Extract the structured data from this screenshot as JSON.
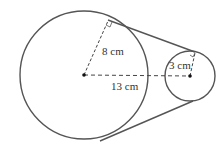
{
  "diagram": {
    "type": "two circles with external common tangents",
    "large_circle": {
      "radius_label": "8 cm"
    },
    "small_circle": {
      "radius_label": "3 cm"
    },
    "center_distance_label": "13 cm",
    "colors": {
      "stroke": "#555555",
      "dashed": "#444444",
      "text": "#333333"
    }
  }
}
